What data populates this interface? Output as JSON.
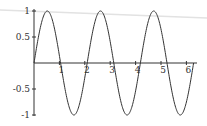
{
  "chart_data": {
    "type": "line",
    "title": "",
    "xlabel": "",
    "ylabel": "",
    "function": "sin(3x)",
    "xlim": [
      0,
      6.2832
    ],
    "ylim": [
      -1,
      1
    ],
    "grid": false,
    "legend": null,
    "x_ticks": [
      "1",
      "2",
      "3",
      "4",
      "5",
      "6"
    ],
    "y_ticks": [
      "1",
      "0.5",
      "-0.5",
      "-1"
    ],
    "series": [
      {
        "name": "sin(3x)",
        "color": "#333333",
        "x": [
          0,
          0.5236,
          1.0472,
          1.5708,
          2.0944,
          2.618,
          3.1416,
          3.6652,
          4.1888,
          4.7124,
          5.236,
          5.7596,
          6.2832
        ],
        "y": [
          0,
          1,
          0,
          -1,
          0,
          1,
          0,
          -1,
          0,
          1,
          0,
          -1,
          0
        ]
      }
    ]
  },
  "colors": {
    "axis": "#333333",
    "curve": "#333333",
    "artifact_line": "#e2e2e2"
  }
}
